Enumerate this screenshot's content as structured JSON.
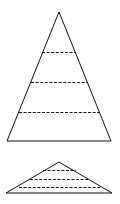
{
  "diagram": {
    "type": "pyramid-comparison",
    "canvas": {
      "width": 120,
      "height": 204
    },
    "stroke_color": "#111111",
    "background": "#ffffff",
    "tall_pyramid": {
      "apex": [
        59,
        12
      ],
      "base_left": [
        7,
        141
      ],
      "base_right": [
        111,
        141
      ],
      "dashed_divisions": [
        {
          "y": 52,
          "x1": 42,
          "x2": 76
        },
        {
          "y": 82,
          "x1": 31,
          "x2": 88
        },
        {
          "y": 112,
          "x1": 19,
          "x2": 100
        }
      ],
      "layers": 4
    },
    "flat_pyramid": {
      "apex": [
        59,
        162
      ],
      "base_left": [
        6,
        193
      ],
      "base_right": [
        112,
        193
      ],
      "dashed_divisions": [
        {
          "y": 170,
          "x1": 43,
          "x2": 76
        },
        {
          "y": 179,
          "x1": 30,
          "x2": 88
        },
        {
          "y": 187,
          "x1": 19,
          "x2": 101
        }
      ],
      "layers": 4
    }
  }
}
